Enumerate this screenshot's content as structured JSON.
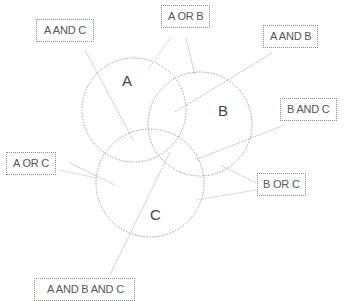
{
  "diagram": {
    "type": "venn",
    "sets": [
      {
        "id": "A",
        "label": "A"
      },
      {
        "id": "B",
        "label": "B"
      },
      {
        "id": "C",
        "label": "C"
      }
    ],
    "callouts": {
      "a_and_c": "A AND C",
      "a_or_b": "A OR B",
      "a_and_b": "A AND B",
      "b_and_c": "B AND C",
      "a_or_c": "A OR C",
      "b_or_c": "B OR C",
      "a_and_b_and_c": "A AND B AND C"
    },
    "colors": {
      "circle_stroke": "#9a9a9a",
      "leader_line": "#b0b0b0",
      "text": "#555555"
    }
  }
}
